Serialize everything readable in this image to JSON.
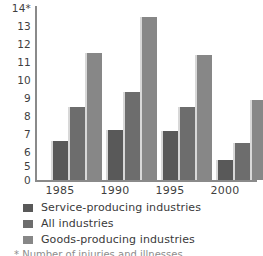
{
  "chart_data": {
    "type": "bar",
    "title": "",
    "subtitle": "",
    "xlabel": "",
    "ylabel": "",
    "categories": [
      "1985",
      "1990",
      "1995",
      "2000"
    ],
    "series": [
      {
        "name": "Service-producing industries",
        "color": "#595959",
        "values": [
          6.1,
          6.7,
          6.65,
          5.05
        ]
      },
      {
        "name": "All industries",
        "color": "#6d6d6d",
        "values": [
          8.0,
          8.85,
          8.0,
          6.0
        ]
      },
      {
        "name": "Goods-producing industries",
        "color": "#878787",
        "values": [
          11.0,
          13.0,
          10.9,
          8.4
        ]
      }
    ],
    "y_tick_labels": [
      "14*",
      "13",
      "12",
      "11",
      "10",
      "9",
      "8",
      "7",
      "6",
      "5",
      "0"
    ],
    "y_tick_values": [
      14,
      13,
      12,
      11,
      10,
      9,
      8,
      7,
      6,
      5,
      0
    ],
    "ylim": [
      5,
      14
    ],
    "axis_note": "y-axis is broken: baseline labelled 0 then scale resumes at 5",
    "grid": false,
    "legend_position": "bottom-left",
    "legend_entries": [
      "Service-producing industries",
      "All industries",
      "Goods-producing industries"
    ],
    "annotations": [
      "14*"
    ]
  },
  "axis": {
    "y_ticks": [
      {
        "label": "14*",
        "value": 14
      },
      {
        "label": "13",
        "value": 13
      },
      {
        "label": "12",
        "value": 12
      },
      {
        "label": "11",
        "value": 11
      },
      {
        "label": "10",
        "value": 10
      },
      {
        "label": "9",
        "value": 9
      },
      {
        "label": "8",
        "value": 8
      },
      {
        "label": "7",
        "value": 7
      },
      {
        "label": "6",
        "value": 6
      },
      {
        "label": "5",
        "value": 5
      },
      {
        "label": "0",
        "value": 0
      }
    ],
    "x_ticks": [
      "1985",
      "1990",
      "1995",
      "2000"
    ]
  },
  "legend": {
    "items": [
      {
        "label": "Service-producing industries",
        "color": "#595959"
      },
      {
        "label": "All industries",
        "color": "#6d6d6d"
      },
      {
        "label": "Goods-producing industries",
        "color": "#878787"
      }
    ]
  },
  "footnote": {
    "text": "* Number of injuries and illnesses"
  }
}
